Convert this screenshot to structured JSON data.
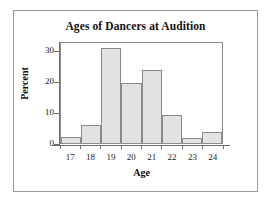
{
  "chart_data": {
    "type": "bar",
    "title": "Ages of Dancers at Audition",
    "xlabel": "Age",
    "ylabel": "Percent",
    "categories": [
      "17",
      "18",
      "19",
      "20",
      "21",
      "22",
      "23",
      "24"
    ],
    "values": [
      2.0,
      6.0,
      31.5,
      19.7,
      24.0,
      9.4,
      1.7,
      3.8
    ],
    "ylim": [
      0,
      33
    ],
    "xlim_labels": [
      "17",
      "24"
    ],
    "ytick_labels": [
      "0",
      "10",
      "20",
      "30"
    ],
    "ytick_values": [
      0,
      10,
      20,
      30
    ],
    "grid": false,
    "legend": false,
    "legend_position": "none",
    "series_name": "Percent of dancers",
    "bar_fill_color": "#e2e2e2",
    "bar_edge_color": "#8a8a8a",
    "axis_color": "#6f6f6f",
    "frame_color": "#9a9a9a",
    "plot_background": "#ffffff"
  }
}
